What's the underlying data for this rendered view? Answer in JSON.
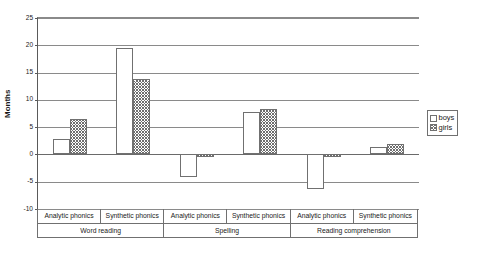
{
  "chart_data": {
    "type": "bar",
    "title": "",
    "xlabel": "",
    "ylabel": "Months",
    "ylim": [
      -10,
      25
    ],
    "ytick_step": 5,
    "yticks": [
      25,
      20,
      15,
      10,
      5,
      0,
      -5,
      -10
    ],
    "ytick_labels": [
      "25",
      "20",
      "15",
      "10",
      "5",
      "0",
      "-5",
      "-10"
    ],
    "grid": true,
    "legend_position": "right",
    "categories": [
      "Analytic phonics",
      "Synthetic phonics",
      "Analytic phonics",
      "Synthetic phonics",
      "Analytic phonics",
      "Synthetic phonics"
    ],
    "groups": [
      {
        "label": "Word reading",
        "span": 2
      },
      {
        "label": "Spelling",
        "span": 2
      },
      {
        "label": "Reading comprehension",
        "span": 2
      }
    ],
    "series": [
      {
        "name": "boys",
        "fill": "open",
        "values": [
          2.8,
          19.5,
          -4.1,
          7.8,
          -6.3,
          1.3
        ]
      },
      {
        "name": "girls",
        "fill": "hatched",
        "values": [
          6.5,
          13.9,
          -0.4,
          8.3,
          -0.5,
          1.9
        ]
      }
    ]
  },
  "legend": {
    "entries": [
      {
        "label": "boys",
        "swatch": "open-square-icon"
      },
      {
        "label": "girls",
        "swatch": "hatched-square-icon"
      }
    ]
  },
  "colors": {
    "axis": "#5a5a5a",
    "gridline": "#8a8a8a",
    "bar_outline": "#707070",
    "hatch": "#6e6e6e",
    "background": "#ffffff",
    "text": "#1a1a1a"
  }
}
